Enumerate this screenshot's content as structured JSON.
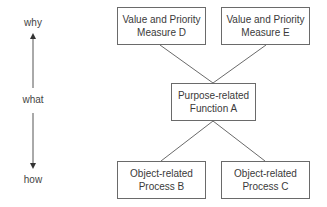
{
  "axis": {
    "top_label": "why",
    "middle_label": "what",
    "bottom_label": "how"
  },
  "nodes": {
    "measure_d": {
      "line1": "Value and Priority",
      "line2": "Measure D"
    },
    "measure_e": {
      "line1": "Value and Priority",
      "line2": "Measure E"
    },
    "function_a": {
      "line1": "Purpose-related",
      "line2": "Function A"
    },
    "process_b": {
      "line1": "Object-related",
      "line2": "Process B"
    },
    "process_c": {
      "line1": "Object-related",
      "line2": "Process C"
    }
  },
  "edges": [
    {
      "from": "measure_d",
      "to": "function_a"
    },
    {
      "from": "measure_e",
      "to": "function_a"
    },
    {
      "from": "function_a",
      "to": "process_b"
    },
    {
      "from": "function_a",
      "to": "process_c"
    }
  ],
  "colors": {
    "line": "#6a6a6a",
    "text": "#3a3a3a"
  }
}
